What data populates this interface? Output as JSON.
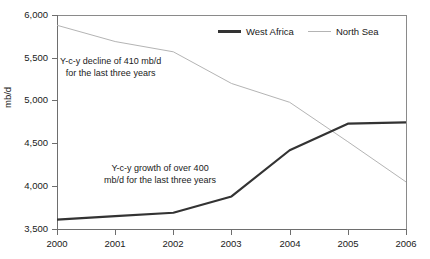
{
  "chart_data": {
    "type": "line",
    "title": "",
    "xlabel": "",
    "ylabel": "mb/d",
    "x": [
      "2000",
      "2001",
      "2002",
      "2003",
      "2004",
      "2005",
      "2006"
    ],
    "xlim": [
      2000,
      2006
    ],
    "ylim": [
      3500,
      6000
    ],
    "yticks": [
      "3,500",
      "4,000",
      "4,500",
      "5,000",
      "5,500",
      "6,000"
    ],
    "ytick_values": [
      3500,
      4000,
      4500,
      5000,
      5500,
      6000
    ],
    "grid": false,
    "legend_position": "top-center-right",
    "series": [
      {
        "name": "West Africa",
        "color": "#333333",
        "width": 2.2,
        "values": [
          3610,
          3650,
          3690,
          3880,
          4420,
          4730,
          4745
        ]
      },
      {
        "name": "North Sea",
        "color": "#b4b4b4",
        "width": 1,
        "values": [
          5880,
          5690,
          5570,
          5200,
          4980,
          4520,
          4050
        ]
      }
    ],
    "annotations": [
      {
        "id": "decline",
        "line1": "Y-c-y decline of 410 mb/d",
        "line2": "for the last three years"
      },
      {
        "id": "growth",
        "line1": "Y-c-y growth of over 400",
        "line2": "mb/d for the last three years"
      }
    ]
  },
  "axis": {
    "y_title": "mb/d",
    "y_labels": [
      "6,000",
      "5,500",
      "5,000",
      "4,500",
      "4,000",
      "3,500"
    ],
    "x_labels": [
      "2000",
      "2001",
      "2002",
      "2003",
      "2004",
      "2005",
      "2006"
    ]
  },
  "legend": {
    "items": [
      {
        "label": "West Africa"
      },
      {
        "label": "North Sea"
      }
    ]
  },
  "annotations": {
    "decline_line1": "Y-c-y decline of 410 mb/d",
    "decline_line2": "for the last three years",
    "growth_line1": "Y-c-y growth of over 400",
    "growth_line2": "mb/d for the last three years"
  },
  "colors": {
    "west_africa": "#333333",
    "north_sea": "#b4b4b4",
    "axis": "#6e6e6e",
    "text": "#1a1a1a",
    "background": "#ffffff"
  }
}
